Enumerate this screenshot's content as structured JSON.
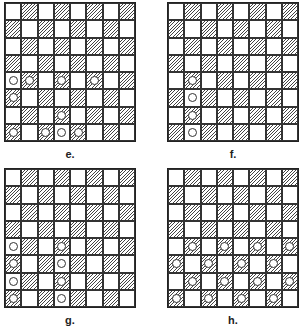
{
  "boards": [
    {
      "id": "e",
      "label": "e.",
      "x": 4,
      "y": 2,
      "pieces": [
        [
          4,
          0
        ],
        [
          4,
          1
        ],
        [
          4,
          3
        ],
        [
          4,
          5
        ],
        [
          5,
          0
        ],
        [
          6,
          3
        ],
        [
          7,
          0
        ],
        [
          7,
          2
        ],
        [
          7,
          3
        ],
        [
          7,
          4
        ]
      ]
    },
    {
      "id": "f",
      "label": "f.",
      "x": 167,
      "y": 2,
      "pieces": [
        [
          4,
          1
        ],
        [
          5,
          1
        ],
        [
          6,
          1
        ],
        [
          7,
          1
        ]
      ]
    },
    {
      "id": "g",
      "label": "g.",
      "x": 4,
      "y": 168,
      "pieces": [
        [
          4,
          0
        ],
        [
          4,
          3
        ],
        [
          5,
          0
        ],
        [
          5,
          3
        ],
        [
          6,
          0
        ],
        [
          6,
          3
        ],
        [
          7,
          0
        ],
        [
          7,
          3
        ]
      ]
    },
    {
      "id": "h",
      "label": "h.",
      "x": 167,
      "y": 168,
      "pieces": [
        [
          4,
          1
        ],
        [
          4,
          3
        ],
        [
          4,
          5
        ],
        [
          4,
          7
        ],
        [
          5,
          0
        ],
        [
          5,
          2
        ],
        [
          5,
          4
        ],
        [
          5,
          6
        ],
        [
          6,
          1
        ],
        [
          6,
          3
        ],
        [
          6,
          5
        ],
        [
          6,
          7
        ],
        [
          7,
          0
        ],
        [
          7,
          2
        ],
        [
          7,
          4
        ],
        [
          7,
          6
        ]
      ]
    }
  ],
  "grid": {
    "rows": 8,
    "cols": 8,
    "hatch_rule": "(row+col) odd"
  },
  "colors": {
    "line": "#222222",
    "hatch": "#444444",
    "background": "#ffffff"
  }
}
